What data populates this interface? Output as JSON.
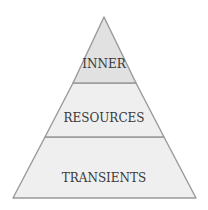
{
  "diagram": {
    "type": "pyramid",
    "colors": {
      "top_fill": "#e1e1e1",
      "tier_fill": "#efefef",
      "stroke": "#9a9a9a",
      "text": "#3a3a3a",
      "background": "#ffffff"
    },
    "tiers": [
      {
        "label": "INNER",
        "level": "top"
      },
      {
        "label": "RESOURCES",
        "level": "middle"
      },
      {
        "label": "TRANSIENTS",
        "level": "bottom"
      }
    ]
  }
}
